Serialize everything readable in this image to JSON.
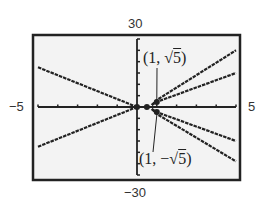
{
  "chart_data": {
    "type": "line",
    "title": "",
    "xlabel": "",
    "ylabel": "",
    "xlim": [
      -5,
      5
    ],
    "ylim": [
      -30,
      30
    ],
    "grid": false,
    "x_tick_step": 1,
    "y_tick_step": 5,
    "window_labels": {
      "ymax": "30",
      "ymin": "−30",
      "xmin": "−5",
      "xmax": "5"
    },
    "series": [
      {
        "name": "left-upper",
        "points": [
          [
            -5,
            17.5
          ],
          [
            0,
            0
          ]
        ]
      },
      {
        "name": "left-lower",
        "points": [
          [
            -5,
            -17.5
          ],
          [
            0,
            0
          ]
        ]
      },
      {
        "name": "right-steep-upper",
        "points": [
          [
            0.75,
            0.9
          ],
          [
            1,
            3.1
          ],
          [
            5,
            25
          ]
        ]
      },
      {
        "name": "right-upper",
        "points": [
          [
            0.75,
            0.9
          ],
          [
            1,
            2.236
          ],
          [
            5,
            15
          ]
        ]
      },
      {
        "name": "right-lower",
        "points": [
          [
            0.75,
            -0.9
          ],
          [
            1,
            -2.236
          ],
          [
            5,
            -15
          ]
        ]
      },
      {
        "name": "right-steep-lower",
        "points": [
          [
            0.75,
            -0.9
          ],
          [
            1,
            -3.1
          ],
          [
            5,
            -24
          ]
        ]
      }
    ],
    "marked_points": [
      {
        "x": 0,
        "y": 0
      },
      {
        "x": 0.5,
        "y": 0
      },
      {
        "x": 1,
        "y": 2.236,
        "label": "(1, √5)"
      },
      {
        "x": 1,
        "y": -2.236,
        "label": "(1, −√5)"
      }
    ],
    "annotations": [
      {
        "text_prefix": "(1, ",
        "radical": "√",
        "radicand": "5",
        "text_suffix": ")",
        "target": [
          1,
          2.236
        ]
      },
      {
        "text_prefix": "(1, −",
        "radical": "√",
        "radicand": "5",
        "text_suffix": ")",
        "target": [
          1,
          -2.236
        ]
      }
    ]
  },
  "colors": {
    "background": "#ffffff",
    "plot_bg": "#f3f3f3",
    "ink": "#222222"
  }
}
